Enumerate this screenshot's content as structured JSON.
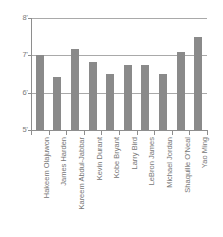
{
  "chart_data": {
    "type": "bar",
    "title": "",
    "subtitle": "",
    "xlabel": "",
    "ylabel": "",
    "grid": true,
    "legend": false,
    "legend_position": "none",
    "orientation": "vertical",
    "bar_color": "#8a8a8a",
    "axis_color": "#8e8e8e",
    "gridline_color": "#a9a9a9",
    "ylim": [
      5,
      8
    ],
    "y_unit": "feet",
    "y_ticks": [
      {
        "value": 5,
        "label": "5'"
      },
      {
        "value": 6,
        "label": "6'"
      },
      {
        "value": 7,
        "label": "7'"
      },
      {
        "value": 8,
        "label": "8'"
      }
    ],
    "categories": [
      "Hakeem Olajuwon",
      "James Harden",
      "Kareem Abdul-Jabbar",
      "Kevin Durant",
      "Kobe Bryant",
      "Larry Bird",
      "LeBron James",
      "Michael Jordan",
      "Shaquille O'Neal",
      "Yao Ming"
    ],
    "values": [
      7.0,
      6.42,
      7.17,
      6.83,
      6.5,
      6.75,
      6.75,
      6.5,
      7.08,
      7.5
    ],
    "value_labels": [
      "7'0\"",
      "6'5\"",
      "7'2\"",
      "6'10\"",
      "6'6\"",
      "6'9\"",
      "6'9\"",
      "6'6\"",
      "7'1\"",
      "7'6\""
    ]
  }
}
